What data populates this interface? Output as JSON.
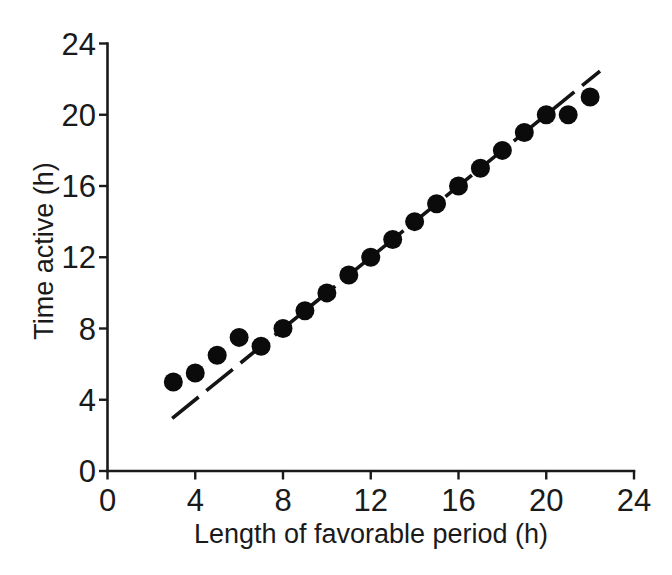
{
  "colors": {
    "background": "#ffffff",
    "ink": "#1a1a1a"
  },
  "chart_data": {
    "type": "scatter",
    "title": "",
    "xlabel": "Length of favorable period (h)",
    "ylabel": "Time active (h)",
    "xlim": [
      0,
      24
    ],
    "ylim": [
      0,
      24
    ],
    "x_ticks": [
      0,
      4,
      8,
      12,
      16,
      20,
      24
    ],
    "y_ticks": [
      0,
      4,
      8,
      12,
      16,
      20,
      24
    ],
    "grid": false,
    "legend": "none",
    "points": [
      [
        3,
        5
      ],
      [
        4,
        5.5
      ],
      [
        5,
        6.5
      ],
      [
        6,
        7.5
      ],
      [
        7,
        7
      ],
      [
        8,
        8
      ],
      [
        9,
        9
      ],
      [
        10,
        10
      ],
      [
        11,
        11
      ],
      [
        12,
        12
      ],
      [
        13,
        13
      ],
      [
        14,
        14
      ],
      [
        15,
        15
      ],
      [
        16,
        16
      ],
      [
        17,
        17
      ],
      [
        18,
        18
      ],
      [
        19,
        19
      ],
      [
        20,
        20
      ],
      [
        21,
        20
      ],
      [
        22,
        21
      ]
    ],
    "marker": {
      "shape": "filled-circle",
      "color": "#0b0b0b",
      "radius_px": 9.5
    },
    "reference_line": {
      "style": "dashed",
      "color": "#141414",
      "from": [
        2.95,
        2.95
      ],
      "to": [
        22.45,
        22.45
      ]
    }
  }
}
